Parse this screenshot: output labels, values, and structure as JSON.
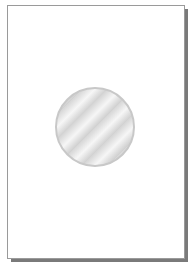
{
  "page": {
    "background": "#ffffff",
    "border_color": "#9a9a9a",
    "shadow_color": "#7a7a7a"
  },
  "graphic": {
    "shape": "circle",
    "style": "silver-striped-disc",
    "colors": [
      "#d6d6d6",
      "#f6f6f6",
      "#c8c8c8"
    ]
  },
  "caption": ""
}
